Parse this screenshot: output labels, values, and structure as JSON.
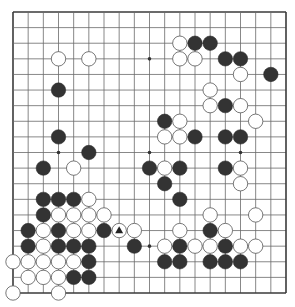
{
  "diagram": {
    "type": "go-board",
    "size": 19,
    "colors": {
      "background": "#ffffff",
      "grid_line": "#6a6a6a",
      "border": "#3a3a3a",
      "black_stone": "#333333",
      "white_stone": "#ffffff",
      "white_stone_outline": "#555555",
      "star_point": "#333333",
      "marker": "#222222"
    },
    "star_points": [
      [
        3,
        3
      ],
      [
        9,
        3
      ],
      [
        15,
        3
      ],
      [
        3,
        9
      ],
      [
        9,
        9
      ],
      [
        15,
        9
      ],
      [
        3,
        15
      ],
      [
        9,
        15
      ],
      [
        15,
        15
      ]
    ],
    "black_stones": [
      [
        12,
        2
      ],
      [
        13,
        2
      ],
      [
        14,
        3
      ],
      [
        15,
        3
      ],
      [
        17,
        4
      ],
      [
        3,
        5
      ],
      [
        14,
        6
      ],
      [
        10,
        7
      ],
      [
        3,
        8
      ],
      [
        12,
        8
      ],
      [
        14,
        8
      ],
      [
        15,
        8
      ],
      [
        5,
        9
      ],
      [
        2,
        10
      ],
      [
        9,
        10
      ],
      [
        11,
        10
      ],
      [
        14,
        10
      ],
      [
        10,
        11
      ],
      [
        11,
        12
      ],
      [
        2,
        12
      ],
      [
        3,
        12
      ],
      [
        4,
        12
      ],
      [
        2,
        13
      ],
      [
        1,
        14
      ],
      [
        3,
        14
      ],
      [
        6,
        14
      ],
      [
        13,
        14
      ],
      [
        1,
        15
      ],
      [
        3,
        15
      ],
      [
        4,
        15
      ],
      [
        5,
        15
      ],
      [
        8,
        15
      ],
      [
        11,
        15
      ],
      [
        14,
        15
      ],
      [
        5,
        16
      ],
      [
        10,
        16
      ],
      [
        11,
        16
      ],
      [
        13,
        16
      ],
      [
        14,
        16
      ],
      [
        15,
        16
      ],
      [
        4,
        17
      ],
      [
        5,
        17
      ]
    ],
    "white_stones": [
      [
        3,
        3
      ],
      [
        5,
        3
      ],
      [
        11,
        2
      ],
      [
        11,
        3
      ],
      [
        12,
        3
      ],
      [
        15,
        4
      ],
      [
        13,
        5
      ],
      [
        13,
        6
      ],
      [
        15,
        6
      ],
      [
        16,
        7
      ],
      [
        11,
        7
      ],
      [
        10,
        8
      ],
      [
        11,
        8
      ],
      [
        10,
        10
      ],
      [
        15,
        10
      ],
      [
        4,
        10
      ],
      [
        15,
        11
      ],
      [
        13,
        13
      ],
      [
        16,
        13
      ],
      [
        11,
        14
      ],
      [
        14,
        14
      ],
      [
        8,
        14
      ],
      [
        7,
        14
      ],
      [
        5,
        12
      ],
      [
        3,
        13
      ],
      [
        4,
        13
      ],
      [
        5,
        13
      ],
      [
        6,
        13
      ],
      [
        2,
        14
      ],
      [
        4,
        14
      ],
      [
        5,
        14
      ],
      [
        2,
        15
      ],
      [
        10,
        15
      ],
      [
        12,
        15
      ],
      [
        13,
        15
      ],
      [
        15,
        15
      ],
      [
        16,
        15
      ],
      [
        0,
        16
      ],
      [
        1,
        16
      ],
      [
        2,
        16
      ],
      [
        3,
        16
      ],
      [
        4,
        16
      ],
      [
        1,
        17
      ],
      [
        2,
        17
      ],
      [
        3,
        17
      ],
      [
        0,
        18
      ],
      [
        3,
        18
      ]
    ],
    "markers": [
      {
        "shape": "triangle",
        "point": [
          7,
          14
        ],
        "on": "white-stone"
      }
    ]
  }
}
